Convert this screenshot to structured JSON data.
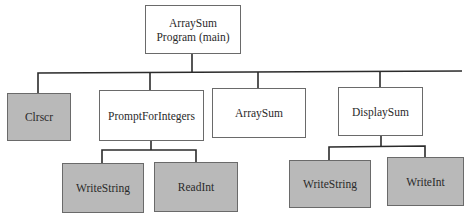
{
  "diagram": {
    "type": "structure-chart",
    "colors": {
      "library_fill": "#b9b9b9",
      "program_fill": "#ffffff",
      "line": "#2b2b2b"
    },
    "root": {
      "label_line1": "ArraySum",
      "label_line2": "Program (main)"
    },
    "level1": [
      {
        "label": "Clrscr",
        "kind": "library"
      },
      {
        "label": "PromptForIntegers",
        "kind": "program"
      },
      {
        "label": "ArraySum",
        "kind": "program"
      },
      {
        "label": "DisplaySum",
        "kind": "program"
      }
    ],
    "level2": {
      "PromptForIntegers": [
        {
          "label": "WriteString",
          "kind": "library"
        },
        {
          "label": "ReadInt",
          "kind": "library"
        }
      ],
      "DisplaySum": [
        {
          "label": "WriteString",
          "kind": "library"
        },
        {
          "label": "WriteInt",
          "kind": "library"
        }
      ]
    }
  }
}
